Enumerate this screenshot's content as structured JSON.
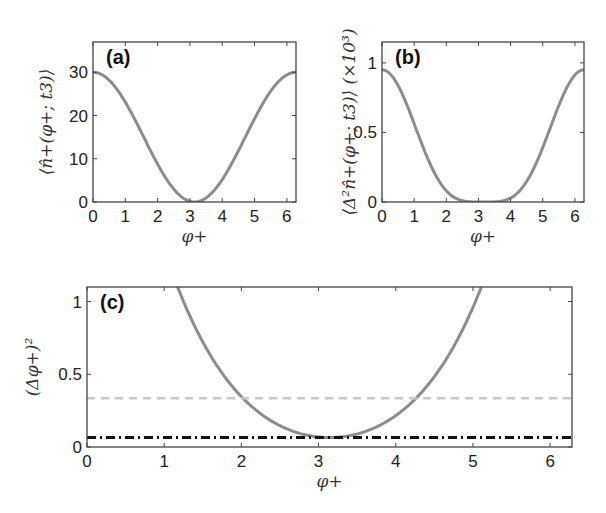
{
  "chart_data": [
    {
      "id": "a",
      "type": "line",
      "panel_label": "(a)",
      "xlabel": "φ+",
      "ylabel": "⟨n̂+(φ+; t3)⟩",
      "xlim": [
        0,
        6.2832
      ],
      "ylim": [
        0,
        37
      ],
      "xticks": [
        "0",
        "1",
        "2",
        "3",
        "4",
        "5",
        "6"
      ],
      "yticks": [
        "0",
        "10",
        "20",
        "30"
      ],
      "grid": false,
      "series": [
        {
          "name": "n_plus",
          "color": "#8c8c8c",
          "style": "solid",
          "formula": "15*(1+cos(x))",
          "x": [
            0,
            0.5,
            1,
            1.5,
            2,
            2.5,
            3,
            3.1416,
            3.5,
            4,
            4.5,
            5,
            5.5,
            6,
            6.2832
          ],
          "values": [
            30,
            28.2,
            23.1,
            16.1,
            8.8,
            3.0,
            0.15,
            0,
            0.95,
            5.2,
            11.6,
            19.3,
            26.4,
            29.4,
            30
          ]
        }
      ]
    },
    {
      "id": "b",
      "type": "line",
      "panel_label": "(b)",
      "xlabel": "φ+",
      "ylabel": "⟨Δ²n̂+(φ+; t3)⟩ (×10³)",
      "xlim": [
        0,
        6.2832
      ],
      "ylim": [
        0,
        1.15
      ],
      "xticks": [
        "0",
        "1",
        "2",
        "3",
        "4",
        "5",
        "6"
      ],
      "yticks": [
        "0",
        "0.5",
        "1"
      ],
      "grid": false,
      "series": [
        {
          "name": "variance",
          "color": "#8c8c8c",
          "style": "solid",
          "formula": "0.95*((1+cos(x))/2)^2",
          "x": [
            0,
            0.5,
            1,
            1.5,
            2,
            2.5,
            3,
            3.1416,
            3.5,
            4,
            4.5,
            5,
            5.5,
            6,
            6.2832
          ],
          "values": [
            0.95,
            0.84,
            0.56,
            0.27,
            0.08,
            0.01,
            0,
            0,
            0,
            0.03,
            0.14,
            0.4,
            0.74,
            0.92,
            0.95
          ]
        }
      ]
    },
    {
      "id": "c",
      "type": "line",
      "panel_label": "(c)",
      "xlabel": "φ+",
      "ylabel": "(Δφ+)²",
      "xlim": [
        0,
        6.2832
      ],
      "ylim": [
        0,
        1.1
      ],
      "xticks": [
        "0",
        "1",
        "2",
        "3",
        "4",
        "5",
        "6"
      ],
      "yticks": [
        "0",
        "0.5",
        "1"
      ],
      "grid": false,
      "series": [
        {
          "name": "phase_uncertainty",
          "color": "#8c8c8c",
          "style": "solid",
          "x": [
            1.6,
            1.8,
            2.0,
            2.2,
            2.4,
            2.6,
            2.8,
            3.0,
            3.1416,
            3.3,
            3.5,
            3.7,
            3.9,
            4.1,
            4.3,
            4.5,
            4.7
          ],
          "values": [
            1.1,
            0.78,
            0.55,
            0.36,
            0.23,
            0.14,
            0.09,
            0.066,
            0.065,
            0.067,
            0.095,
            0.15,
            0.24,
            0.38,
            0.57,
            0.8,
            1.1
          ]
        },
        {
          "name": "dashed_bound",
          "color": "#c8c8c8",
          "style": "dashed",
          "x": [
            0,
            6.2832
          ],
          "values": [
            0.335,
            0.335
          ]
        },
        {
          "name": "dashdot_bound",
          "color": "#111111",
          "style": "dash-dot",
          "x": [
            0,
            6.2832
          ],
          "values": [
            0.065,
            0.065
          ]
        }
      ]
    }
  ]
}
